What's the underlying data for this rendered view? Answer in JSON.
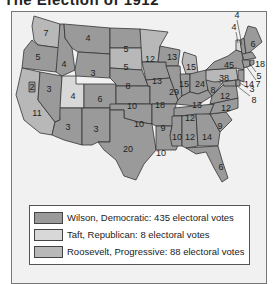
{
  "title": "The Election of 1912",
  "colors": {
    "wilson": "#9a9a9a",
    "taft": "#d8d8d8",
    "roosevelt": "#b8b8b8",
    "background": "#f1f1f1"
  },
  "legend": {
    "items": [
      {
        "label": "Wilson, Democratic: 435 electoral votes",
        "party": "wilson"
      },
      {
        "label": "Taft, Republican: 8 electoral votes",
        "party": "taft"
      },
      {
        "label": "Roosevelt, Progressive: 88 electoral votes",
        "party": "roosevelt"
      }
    ]
  },
  "states": {
    "WA": {
      "votes": "7",
      "party": "roosevelt"
    },
    "OR": {
      "votes": "5",
      "party": "wilson"
    },
    "CA_N": {
      "votes": "2",
      "party": "wilson"
    },
    "CA": {
      "votes": "11",
      "party": "roosevelt"
    },
    "ID": {
      "votes": "4",
      "party": "wilson"
    },
    "NV": {
      "votes": "3",
      "party": "wilson"
    },
    "UT": {
      "votes": "4",
      "party": "taft"
    },
    "AZ": {
      "votes": "3",
      "party": "wilson"
    },
    "MT": {
      "votes": "4",
      "party": "wilson"
    },
    "WY": {
      "votes": "3",
      "party": "wilson"
    },
    "CO": {
      "votes": "6",
      "party": "wilson"
    },
    "NM": {
      "votes": "3",
      "party": "wilson"
    },
    "ND": {
      "votes": "5",
      "party": "wilson"
    },
    "SD": {
      "votes": "5",
      "party": "roosevelt"
    },
    "NE": {
      "votes": "8",
      "party": "wilson"
    },
    "KS": {
      "votes": "10",
      "party": "wilson"
    },
    "OK": {
      "votes": "10",
      "party": "wilson"
    },
    "TX": {
      "votes": "20",
      "party": "wilson"
    },
    "MN": {
      "votes": "12",
      "party": "roosevelt"
    },
    "IA": {
      "votes": "13",
      "party": "wilson"
    },
    "MO": {
      "votes": "18",
      "party": "wilson"
    },
    "AR": {
      "votes": "9",
      "party": "wilson"
    },
    "LA": {
      "votes": "10",
      "party": "wilson"
    },
    "WI": {
      "votes": "13",
      "party": "wilson"
    },
    "IL": {
      "votes": "29",
      "party": "wilson"
    },
    "MI": {
      "votes": "15",
      "party": "roosevelt"
    },
    "IN": {
      "votes": "15",
      "party": "wilson"
    },
    "OH": {
      "votes": "24",
      "party": "wilson"
    },
    "KY": {
      "votes": "13",
      "party": "wilson"
    },
    "TN": {
      "votes": "12",
      "party": "wilson"
    },
    "MS": {
      "votes": "10",
      "party": "wilson"
    },
    "AL": {
      "votes": "12",
      "party": "wilson"
    },
    "GA": {
      "votes": "14",
      "party": "wilson"
    },
    "FL": {
      "votes": "6",
      "party": "wilson"
    },
    "SC": {
      "votes": "9",
      "party": "wilson"
    },
    "NC": {
      "votes": "12",
      "party": "wilson"
    },
    "VA": {
      "votes": "12",
      "party": "wilson"
    },
    "WV": {
      "votes": "8",
      "party": "wilson"
    },
    "PA": {
      "votes": "38",
      "party": "roosevelt"
    },
    "NY": {
      "votes": "45",
      "party": "wilson"
    },
    "VT": {
      "votes": "4",
      "party": "taft"
    },
    "NH": {
      "votes": "4",
      "party": "wilson"
    },
    "ME": {
      "votes": "6",
      "party": "wilson"
    },
    "MA": {
      "votes": "18",
      "party": "wilson"
    },
    "RI": {
      "votes": "5",
      "party": "wilson"
    },
    "CT": {
      "votes": "7",
      "party": "wilson"
    },
    "NJ": {
      "votes": "14",
      "party": "wilson"
    },
    "DE": {
      "votes": "3",
      "party": "wilson"
    },
    "MD": {
      "votes": "8",
      "party": "wilson"
    }
  }
}
